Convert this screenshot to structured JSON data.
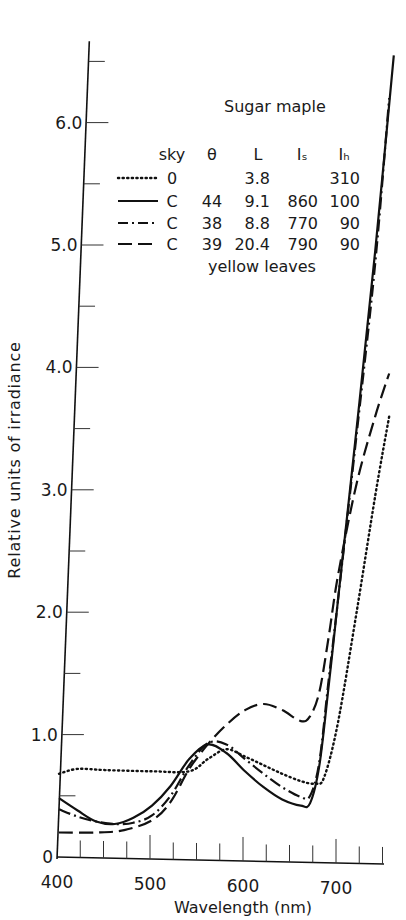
{
  "chart_data": {
    "type": "line",
    "title": "Sugar maple",
    "subtitle": "yellow leaves",
    "xlabel": "Wavelength (nm)",
    "ylabel": "Relative units of irradiance",
    "xlim": [
      400,
      760
    ],
    "ylim": [
      0,
      6.6
    ],
    "x_ticks": [
      400,
      500,
      600,
      700
    ],
    "x_minor_step": 25,
    "y_ticks": [
      0,
      1.0,
      2.0,
      3.0,
      4.0,
      5.0,
      6.0
    ],
    "y_tick_labels": [
      "0",
      "1.0",
      "2.0",
      "3.0",
      "4.0",
      "5.0",
      "6.0"
    ],
    "y_minor_step": 0.5,
    "grid": false,
    "legend_position": "upper right (inside plot)",
    "legend_columns": [
      "sky",
      "θ",
      "L",
      "Is",
      "Ih"
    ],
    "series": [
      {
        "name": "sky 0",
        "style": "dotted",
        "sky": "0",
        "theta": "",
        "L": "3.8",
        "Is": "",
        "Ih": "310",
        "x": [
          400,
          420,
          450,
          500,
          540,
          560,
          580,
          600,
          620,
          640,
          660,
          675,
          685,
          700,
          720,
          740,
          755
        ],
        "y": [
          0.68,
          0.72,
          0.71,
          0.7,
          0.7,
          0.8,
          0.88,
          0.82,
          0.75,
          0.68,
          0.62,
          0.6,
          0.65,
          1.1,
          2.0,
          2.95,
          3.6
        ]
      },
      {
        "name": "sky C, θ 44",
        "style": "solid",
        "sky": "C",
        "theta": "44",
        "L": "9.1",
        "Is": "860",
        "Ih": "100",
        "x": [
          400,
          420,
          440,
          460,
          480,
          500,
          520,
          540,
          560,
          580,
          600,
          620,
          640,
          660,
          670,
          680,
          690,
          700,
          720,
          740,
          760
        ],
        "y": [
          0.48,
          0.38,
          0.29,
          0.27,
          0.32,
          0.42,
          0.58,
          0.8,
          0.92,
          0.85,
          0.7,
          0.57,
          0.47,
          0.42,
          0.44,
          0.75,
          1.4,
          2.1,
          3.5,
          4.95,
          6.55
        ]
      },
      {
        "name": "sky C, θ 38",
        "style": "dash-dot",
        "sky": "C",
        "theta": "38",
        "L": "8.8",
        "Is": "770",
        "Ih": "90",
        "x": [
          400,
          420,
          440,
          460,
          480,
          500,
          520,
          540,
          560,
          580,
          600,
          620,
          640,
          660,
          670,
          680,
          690,
          700,
          720,
          740,
          755
        ],
        "y": [
          0.39,
          0.33,
          0.29,
          0.27,
          0.28,
          0.34,
          0.5,
          0.75,
          0.93,
          0.92,
          0.8,
          0.68,
          0.57,
          0.49,
          0.5,
          0.78,
          1.45,
          2.1,
          3.45,
          4.85,
          6.2
        ]
      },
      {
        "name": "sky C, θ 39",
        "style": "dashed",
        "sky": "C",
        "theta": "39",
        "L": "20.4",
        "Is": "790",
        "Ih": "90",
        "x": [
          400,
          440,
          470,
          500,
          520,
          540,
          560,
          580,
          600,
          620,
          640,
          660,
          670,
          680,
          690,
          700,
          720,
          740,
          755
        ],
        "y": [
          0.2,
          0.2,
          0.22,
          0.3,
          0.45,
          0.72,
          0.92,
          1.08,
          1.2,
          1.25,
          1.2,
          1.11,
          1.15,
          1.35,
          1.8,
          2.3,
          3.05,
          3.6,
          3.95
        ]
      }
    ]
  },
  "legend": {
    "title": "Sugar maple",
    "headers": [
      "sky",
      "θ",
      "L",
      "Iₛ",
      "Iₕ"
    ],
    "rows": [
      {
        "style": "dotted",
        "sky": "0",
        "theta": "",
        "L": "3.8",
        "Is": "",
        "Ih": "310"
      },
      {
        "style": "solid",
        "sky": "C",
        "theta": "44",
        "L": "9.1",
        "Is": "860",
        "Ih": "100"
      },
      {
        "style": "dash-dot",
        "sky": "C",
        "theta": "38",
        "L": "8.8",
        "Is": "770",
        "Ih": "90"
      },
      {
        "style": "dashed",
        "sky": "C",
        "theta": "39",
        "L": "20.4",
        "Is": "790",
        "Ih": "90"
      }
    ],
    "footnote": "yellow leaves"
  },
  "axes": {
    "x_title": "Wavelength (nm)",
    "y_title": "Relative units of irradiance"
  }
}
